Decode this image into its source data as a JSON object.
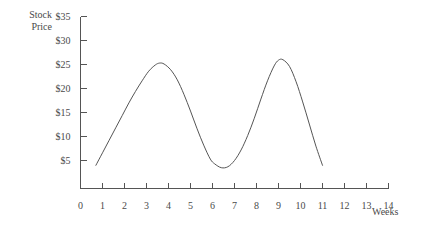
{
  "chart_data": {
    "type": "line",
    "title": "",
    "subtitle": "",
    "xlabel": "Weeks",
    "ylabel": "Stock\nPrice",
    "ylabel_line1": "Stock",
    "ylabel_line2": "Price",
    "xlim": [
      0,
      14
    ],
    "ylim": [
      0,
      35
    ],
    "grid": false,
    "legend": null,
    "x_tick_labels": [
      "0",
      "1",
      "2",
      "3",
      "4",
      "5",
      "6",
      "7",
      "8",
      "9",
      "10",
      "11",
      "12",
      "13",
      "14"
    ],
    "x_tick_values": [
      0,
      1,
      2,
      3,
      4,
      5,
      6,
      7,
      8,
      9,
      10,
      11,
      12,
      13,
      14
    ],
    "y_tick_labels": [
      "$5",
      "$10",
      "$15",
      "$20",
      "$25",
      "$30",
      "$35"
    ],
    "y_tick_values": [
      5,
      10,
      15,
      20,
      25,
      30,
      35
    ],
    "line_color": "#555555",
    "axis_color": "#555555",
    "series": [
      {
        "name": "Stock Price",
        "x": [
          0.7,
          1.0,
          1.3,
          1.6,
          1.9,
          2.2,
          2.5,
          2.8,
          3.1,
          3.4,
          3.6,
          3.8,
          4.1,
          4.4,
          4.7,
          5.0,
          5.3,
          5.6,
          5.9,
          6.1,
          6.4,
          6.7,
          7.0,
          7.3,
          7.6,
          7.9,
          8.2,
          8.5,
          8.8,
          9.0,
          9.2,
          9.5,
          9.8,
          10.1,
          10.4,
          10.7,
          11.0
        ],
        "y": [
          4.0,
          6.6,
          9.2,
          11.8,
          14.4,
          17.0,
          19.4,
          21.6,
          23.6,
          24.9,
          25.3,
          25.1,
          23.9,
          21.8,
          18.8,
          15.3,
          11.6,
          8.2,
          5.3,
          4.3,
          3.5,
          3.7,
          5.0,
          7.2,
          10.2,
          13.8,
          17.8,
          21.6,
          24.7,
          25.9,
          26.0,
          24.6,
          21.4,
          17.2,
          12.6,
          8.0,
          4.0
        ]
      }
    ],
    "annotations": [],
    "peaks": [
      {
        "x": 3.6,
        "y": 25.3
      },
      {
        "x": 9.2,
        "y": 26.0
      }
    ],
    "troughs": [
      {
        "x": 6.4,
        "y": 3.5
      }
    ]
  }
}
